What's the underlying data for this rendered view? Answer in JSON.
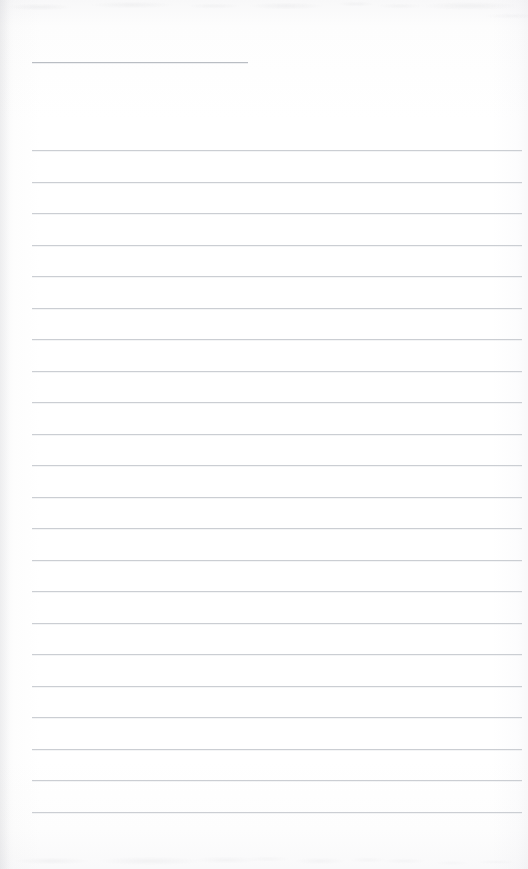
{
  "document": {
    "kind": "scanned-blank-ruled-page",
    "title": "",
    "visible_text": "",
    "page_width": 528,
    "page_height": 869,
    "paper_color": "#fefefe",
    "rule_color": "#cbced3",
    "header_rule_color": "#b9bdc3"
  },
  "header_blank": {
    "name": "header-blank-rule",
    "x": 32,
    "y": 62,
    "width": 216,
    "filled_text": ""
  },
  "ruled_area": {
    "left": 32,
    "right": 522,
    "width": 490,
    "first_line_y": 150,
    "last_line_y": 812,
    "line_spacing": 31.5,
    "line_count": 22,
    "lines": [
      {
        "index": 1,
        "y": 150,
        "text": ""
      },
      {
        "index": 2,
        "y": 182,
        "text": ""
      },
      {
        "index": 3,
        "y": 213,
        "text": ""
      },
      {
        "index": 4,
        "y": 245,
        "text": ""
      },
      {
        "index": 5,
        "y": 276,
        "text": ""
      },
      {
        "index": 6,
        "y": 308,
        "text": ""
      },
      {
        "index": 7,
        "y": 339,
        "text": ""
      },
      {
        "index": 8,
        "y": 371,
        "text": ""
      },
      {
        "index": 9,
        "y": 402,
        "text": ""
      },
      {
        "index": 10,
        "y": 434,
        "text": ""
      },
      {
        "index": 11,
        "y": 465,
        "text": ""
      },
      {
        "index": 12,
        "y": 497,
        "text": ""
      },
      {
        "index": 13,
        "y": 528,
        "text": ""
      },
      {
        "index": 14,
        "y": 560,
        "text": ""
      },
      {
        "index": 15,
        "y": 591,
        "text": ""
      },
      {
        "index": 16,
        "y": 623,
        "text": ""
      },
      {
        "index": 17,
        "y": 654,
        "text": ""
      },
      {
        "index": 18,
        "y": 686,
        "text": ""
      },
      {
        "index": 19,
        "y": 717,
        "text": ""
      },
      {
        "index": 20,
        "y": 749,
        "text": ""
      },
      {
        "index": 21,
        "y": 780,
        "text": ""
      },
      {
        "index": 22,
        "y": 812,
        "text": ""
      }
    ]
  },
  "artifacts": {
    "top_noise_band_height": 26,
    "bottom_noise_band_height": 34,
    "left_edge_shadow_width": 10
  }
}
